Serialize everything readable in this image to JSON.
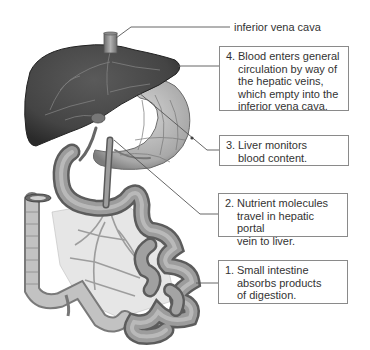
{
  "diagram": {
    "structures": [
      "liver",
      "inferior vena cava",
      "stomach",
      "hepatic portal vein",
      "small intestine",
      "large intestine (colon)",
      "mesenteric veins"
    ],
    "colors": {
      "liver": "#4a4a4a",
      "liver_dark": "#2e2e2e",
      "organs": "#9a9a9a",
      "organs_light": "#c8c8c8",
      "mesentery": "#e4e4e4",
      "leader_line": "#555555",
      "box_border": "#8a8a8a",
      "text": "#333333"
    }
  },
  "labels": {
    "ivc": "inferior vena cava",
    "steps": [
      {
        "num": "1.",
        "text": "Small intestine\nabsorbs products\nof digestion."
      },
      {
        "num": "2.",
        "text": "Nutrient molecules\ntravel in hepatic portal\nvein to liver."
      },
      {
        "num": "3.",
        "text": "Liver monitors\nblood content."
      },
      {
        "num": "4.",
        "text": "Blood enters general\ncirculation by way of\nthe hepatic veins,\nwhich empty into the\ninferior vena cava."
      }
    ]
  }
}
